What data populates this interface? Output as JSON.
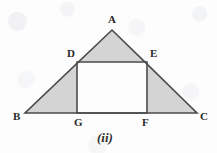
{
  "figure": {
    "caption": "(ii)",
    "canvas": {
      "width": 217,
      "height": 153
    },
    "colors": {
      "background": "#fdfdfd",
      "shade_fill": "#d4d4d4",
      "stroke": "#4a4a4a",
      "label_text": "#2a2a2a",
      "caption_text": "#2f2f2f"
    },
    "points": {
      "A": {
        "x": 112,
        "y": 30
      },
      "B": {
        "x": 25,
        "y": 113
      },
      "C": {
        "x": 197,
        "y": 113
      },
      "D": {
        "x": 77,
        "y": 62
      },
      "E": {
        "x": 147,
        "y": 62
      },
      "F": {
        "x": 147,
        "y": 113
      },
      "G": {
        "x": 77,
        "y": 113
      }
    },
    "labels": [
      {
        "text": "A",
        "x": 108,
        "y": 14
      },
      {
        "text": "D",
        "x": 67,
        "y": 48
      },
      {
        "text": "E",
        "x": 150,
        "y": 48
      },
      {
        "text": "B",
        "x": 13,
        "y": 111
      },
      {
        "text": "G",
        "x": 74,
        "y": 117
      },
      {
        "text": "F",
        "x": 142,
        "y": 117
      },
      {
        "text": "C",
        "x": 200,
        "y": 111
      }
    ],
    "shaded_regions": [
      {
        "name": "apex-triangle-ADE",
        "polygon": "112,30 77,62 147,62"
      },
      {
        "name": "left-triangle-BGD",
        "polygon": "25,113 77,113 77,62"
      },
      {
        "name": "right-triangle-FCE",
        "polygon": "147,113 197,113 147,62"
      }
    ],
    "unshaded_regions": [
      {
        "name": "rectangle-DEFG",
        "polygon": "77,62 147,62 147,113 77,113"
      }
    ],
    "outlines": [
      {
        "name": "triangle-ABC",
        "polygon": "112,30 197,113 25,113"
      },
      {
        "name": "rectangle-DEFG",
        "polygon": "77,62 147,62 147,113 77,113"
      }
    ]
  }
}
